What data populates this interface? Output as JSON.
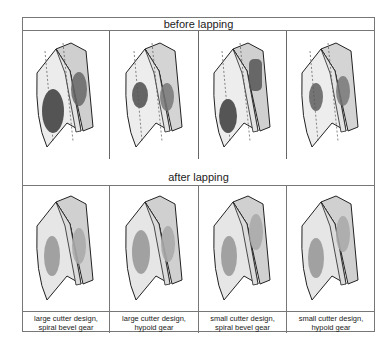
{
  "figure": {
    "header_before": "before lapping",
    "header_after": "after lapping",
    "columns": [
      {
        "caption_line1": "large cutter design,",
        "caption_line2": "spiral bevel gear",
        "before_patch": "large-dark",
        "after_patch": "mid-gray"
      },
      {
        "caption_line1": "large cutter design,",
        "caption_line2": "hypoid gear",
        "before_patch": "small-dark",
        "after_patch": "mid-gray"
      },
      {
        "caption_line1": "small cutter design,",
        "caption_line2": "spiral bevel gear",
        "before_patch": "offset-dark",
        "after_patch": "mid-gray"
      },
      {
        "caption_line1": "small cutter design,",
        "caption_line2": "hypoid gear",
        "before_patch": "small-dark",
        "after_patch": "mid-gray"
      }
    ]
  }
}
